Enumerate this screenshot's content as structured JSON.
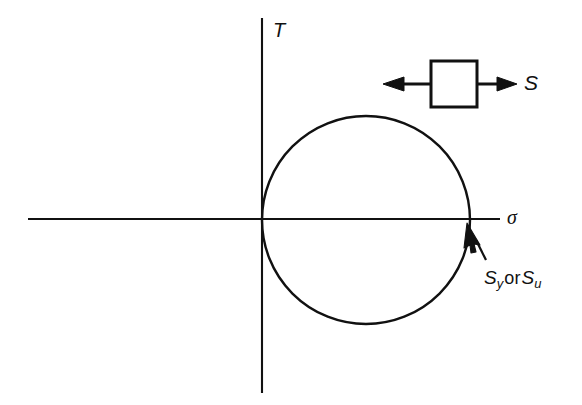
{
  "figure": {
    "type": "engineering-diagram",
    "background_color": "#ffffff",
    "stroke_color": "#111111",
    "width": 582,
    "height": 405
  },
  "axes": {
    "vertical": {
      "label": "T",
      "name": "shear-stress-axis",
      "x": 262,
      "y_top": 18,
      "y_bottom": 393,
      "label_x": 274,
      "label_y": 22
    },
    "horizontal": {
      "label": "σ",
      "name": "normal-stress-axis",
      "y": 219,
      "x_left": 28,
      "x_right": 500,
      "label_x": 507,
      "label_y": 209
    }
  },
  "circle": {
    "name": "mohr-circle",
    "center_x": 366,
    "center_y": 220,
    "radius": 104,
    "tangent_point_x": 262,
    "intersection_x": 470
  },
  "element": {
    "name": "stress-element",
    "square": {
      "x": 431,
      "y": 61,
      "size": 46
    },
    "left_arrow": {
      "from_x": 431,
      "to_x": 385,
      "y": 84
    },
    "right_arrow": {
      "from_x": 477,
      "to_x": 516,
      "y": 84
    },
    "label": "S",
    "label_x": 524,
    "label_y": 73
  },
  "annotation": {
    "name": "strength-callout",
    "symbol_1": "S",
    "subscript_1": "y",
    "conjunction": "or",
    "symbol_2": "S",
    "subscript_2": "u",
    "text_x": 484,
    "text_y": 270,
    "pointer": {
      "tail_x": 485,
      "tail_y": 258,
      "tip_x": 468,
      "tip_y": 224
    }
  }
}
